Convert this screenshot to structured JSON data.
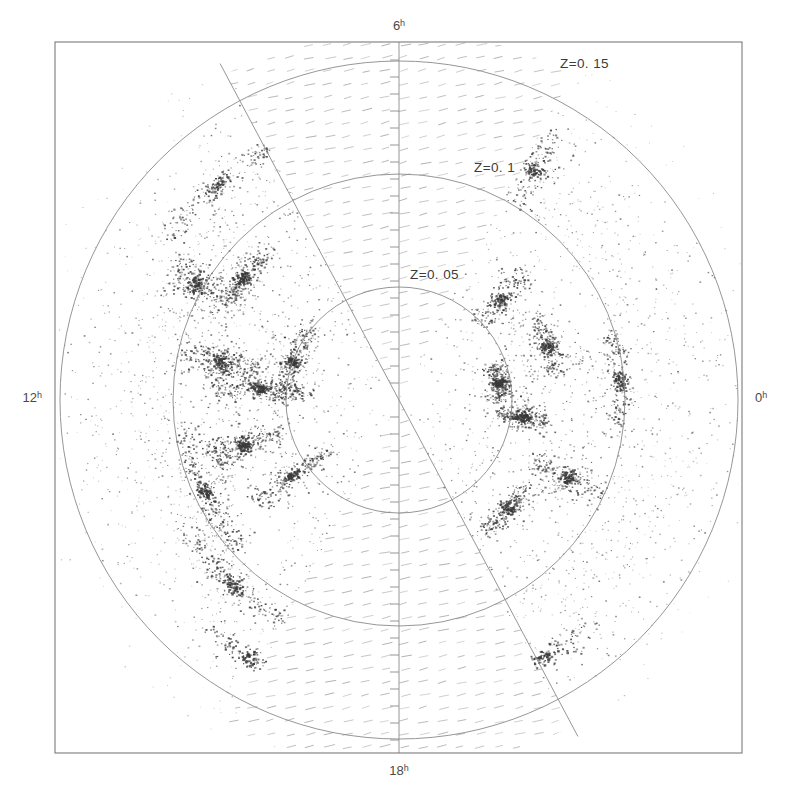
{
  "figure": {
    "frame": {
      "x": 55,
      "y": 42,
      "width": 687,
      "height": 711
    },
    "center": {
      "x": 399,
      "y": 400
    }
  },
  "axis_labels": [
    {
      "name": "ra-6h",
      "value": "6",
      "sup": "h",
      "x": 399,
      "y": 30,
      "anchor": "middle"
    },
    {
      "name": "ra-0h",
      "value": "0",
      "sup": "h",
      "x": 755,
      "y": 402,
      "anchor": "start"
    },
    {
      "name": "ra-18h",
      "value": "18",
      "sup": "h",
      "x": 399,
      "y": 775,
      "anchor": "middle"
    },
    {
      "name": "ra-12h",
      "value": "12",
      "sup": "h",
      "x": 42,
      "y": 402,
      "anchor": "end"
    }
  ],
  "redshift_circles": [
    {
      "name": "z-005",
      "label": "Z=0. 05",
      "z": 0.05,
      "radius": 113,
      "label_x": 410,
      "label_y": 279
    },
    {
      "name": "z-01",
      "label": "Z=0. 1",
      "z": 0.1,
      "radius": 226,
      "label_x": 474,
      "label_y": 172
    },
    {
      "name": "z-015",
      "label": "Z=0. 15",
      "z": 0.15,
      "radius": 339,
      "label_x": 560,
      "label_y": 68
    }
  ],
  "zone_of_avoidance": {
    "description": "Hatched wedges mark the unsurveyed Galactic plane zone of avoidance",
    "hatch_color": "#9a9a9a",
    "wedges": [
      {
        "name": "upper-wedge",
        "start_angle_deg": 90,
        "end_angle_deg": 118
      },
      {
        "name": "lower-wedge",
        "start_angle_deg": 270,
        "end_angle_deg": 298
      }
    ]
  },
  "colors": {
    "galaxy_point": "#3a3a3a",
    "grid_line": "#8a8a8a",
    "frame": "#7a7a7a",
    "hatch": "#9a9a9a",
    "background": "#ffffff"
  },
  "chart_data": {
    "type": "scatter",
    "title": "",
    "xlabel": "",
    "ylabel": "",
    "projection": "polar-cone",
    "angular_coordinate": "Right Ascension (hours)",
    "radial_coordinate": "Redshift Z",
    "radial_ticks": [
      0.05,
      0.1,
      0.15
    ],
    "radial_tick_labels": [
      "Z=0. 05",
      "Z=0. 1",
      "Z=0. 15"
    ],
    "angular_ticks_hours": [
      0,
      6,
      12,
      18
    ],
    "angular_tick_labels": [
      "0h",
      "6h",
      "12h",
      "18h"
    ],
    "rlim": [
      0,
      0.15
    ],
    "grid": true,
    "legend": false,
    "point_count_approx": 9000,
    "structure_note": "Filamentary large-scale structure: walls, filaments and voids traced by galaxies",
    "filament_seeds": [
      {
        "ra_deg": 175,
        "z": 0.062,
        "weight": 0.95
      },
      {
        "ra_deg": 168,
        "z": 0.081,
        "weight": 0.9
      },
      {
        "ra_deg": 160,
        "z": 0.05,
        "weight": 0.85
      },
      {
        "ra_deg": 196,
        "z": 0.072,
        "weight": 0.88
      },
      {
        "ra_deg": 205,
        "z": 0.095,
        "weight": 0.8
      },
      {
        "ra_deg": 150,
        "z": 0.104,
        "weight": 0.78
      },
      {
        "ra_deg": 142,
        "z": 0.088,
        "weight": 0.82
      },
      {
        "ra_deg": 215,
        "z": 0.058,
        "weight": 0.75
      },
      {
        "ra_deg": 228,
        "z": 0.11,
        "weight": 0.7
      },
      {
        "ra_deg": 10,
        "z": 0.045,
        "weight": 0.92
      },
      {
        "ra_deg": 352,
        "z": 0.055,
        "weight": 0.86
      },
      {
        "ra_deg": 20,
        "z": 0.07,
        "weight": 0.74
      },
      {
        "ra_deg": 335,
        "z": 0.082,
        "weight": 0.72
      },
      {
        "ra_deg": 5,
        "z": 0.098,
        "weight": 0.68
      },
      {
        "ra_deg": 45,
        "z": 0.063,
        "weight": 0.66
      },
      {
        "ra_deg": 315,
        "z": 0.068,
        "weight": 0.7
      },
      {
        "ra_deg": 130,
        "z": 0.125,
        "weight": 0.6
      },
      {
        "ra_deg": 60,
        "z": 0.118,
        "weight": 0.55
      },
      {
        "ra_deg": 300,
        "z": 0.13,
        "weight": 0.52
      },
      {
        "ra_deg": 240,
        "z": 0.132,
        "weight": 0.5
      }
    ]
  }
}
